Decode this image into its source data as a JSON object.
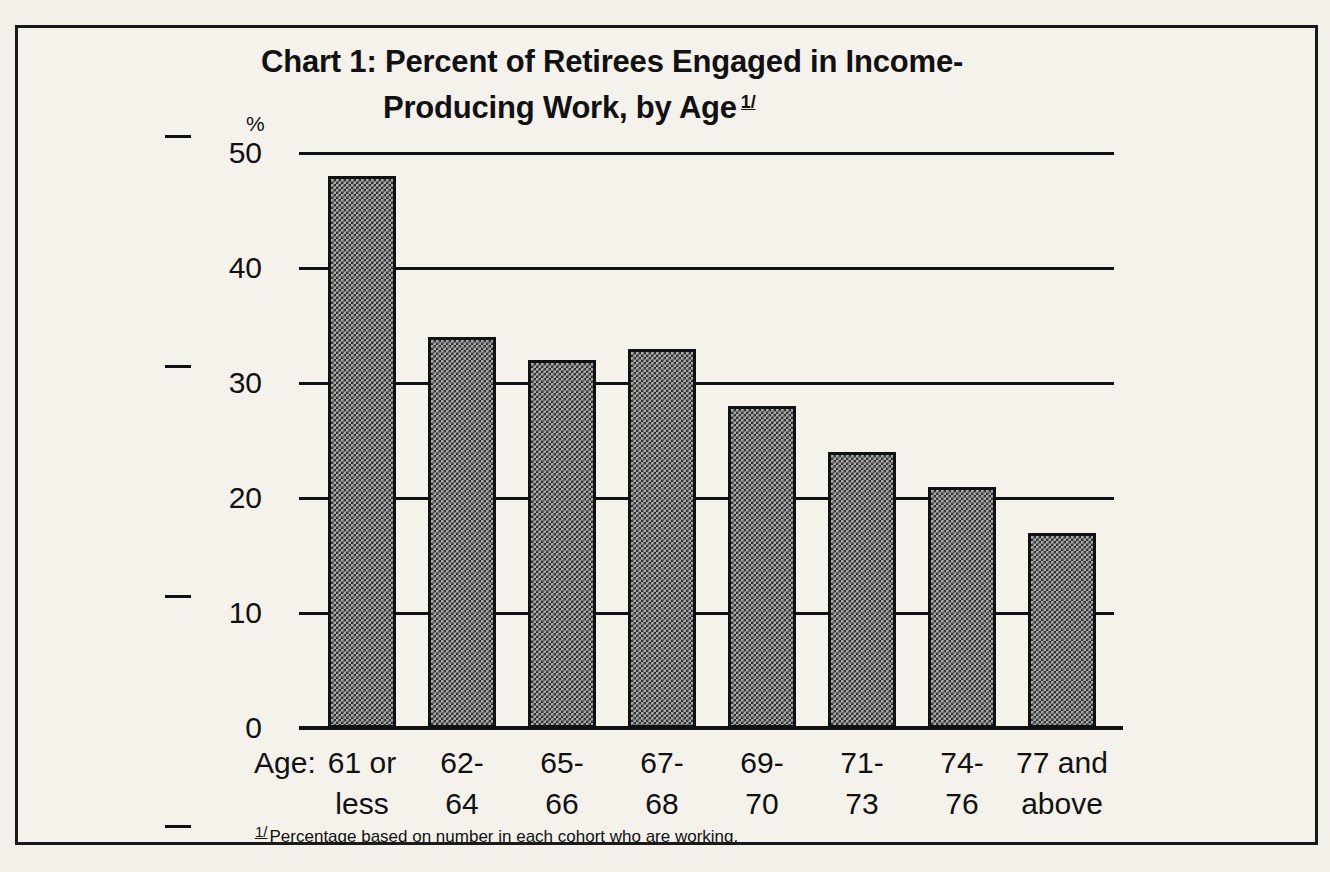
{
  "figure": {
    "title_line1": "Chart 1:  Percent of Retirees Engaged in Income-",
    "title_line2": "Producing Work, by Age",
    "title_footnote_marker": "1/",
    "percent_symbol": "%",
    "age_prefix": "Age:",
    "footnote_marker": "1/",
    "footnote_text": "Percentage based on number in each cohort who are working.",
    "border_color": "#1a1a1a",
    "bar_fill_color": "#a8a8a8",
    "bar_outline_color": "#111111",
    "background_color": "#f4f2eb"
  },
  "chart_data": {
    "type": "bar",
    "xlabel": "Age:",
    "ylabel": "%",
    "ylim": [
      0,
      50
    ],
    "yticks": [
      0,
      10,
      20,
      30,
      40,
      50
    ],
    "ytick_labels": [
      "0",
      "10",
      "20",
      "30",
      "40",
      "50"
    ],
    "grid": true,
    "legend": "none",
    "categories": [
      "61 or less",
      "62-64",
      "65-66",
      "67-68",
      "69-70",
      "71-73",
      "74-76",
      "77 and above"
    ],
    "category_lines": [
      [
        "61 or",
        "less"
      ],
      [
        "62-",
        "64"
      ],
      [
        "65-",
        "66"
      ],
      [
        "67-",
        "68"
      ],
      [
        "69-",
        "70"
      ],
      [
        "71-",
        "73"
      ],
      [
        "74-",
        "76"
      ],
      [
        "77 and",
        "above"
      ]
    ],
    "values": [
      48,
      34,
      32,
      33,
      28,
      24,
      21,
      17
    ],
    "annotation": "1/ Percentage based on number in each cohort who are working."
  }
}
